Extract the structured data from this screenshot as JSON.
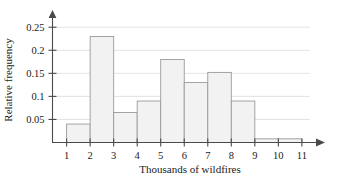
{
  "chart_data": {
    "type": "bar",
    "title": "",
    "subtitle": "",
    "xlabel": "Thousands of wildfires",
    "ylabel": "Relative frequency",
    "categories": [
      "1-2",
      "2-3",
      "3-4",
      "4-5",
      "5-6",
      "6-7",
      "7-8",
      "8-9",
      "9-10",
      "10-11"
    ],
    "bin_edges": [
      1,
      2,
      3,
      4,
      5,
      6,
      7,
      8,
      9,
      10,
      11
    ],
    "values": [
      0.04,
      0.23,
      0.065,
      0.09,
      0.18,
      0.13,
      0.152,
      0.09,
      0.008,
      0.008
    ],
    "xlim": [
      0.4,
      11.6
    ],
    "ylim": [
      0,
      0.27
    ],
    "x_ticks": [
      "1",
      "2",
      "3",
      "4",
      "5",
      "6",
      "7",
      "8",
      "9",
      "10",
      "11"
    ],
    "x_tick_values": [
      1,
      2,
      3,
      4,
      5,
      6,
      7,
      8,
      9,
      10,
      11
    ],
    "y_ticks": [
      "0.05",
      "0.1",
      "0.15",
      "0.2",
      "0.25"
    ],
    "y_tick_values": [
      0.05,
      0.1,
      0.15,
      0.2,
      0.25
    ],
    "grid": true,
    "grid_axis": "y",
    "legend": false,
    "legend_position": "none",
    "bar_fill_color": "#f2f2f2",
    "bar_edge_color": "#9a9a9a",
    "grid_color": "#dcdcdc",
    "axis_color": "#4a4a4a"
  }
}
